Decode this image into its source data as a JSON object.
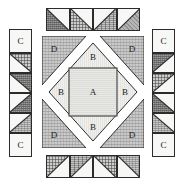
{
  "diagram": {
    "type": "quilt-block-layout",
    "labels": {
      "a": "A",
      "b": "B",
      "c": "C",
      "d": "D"
    },
    "colors": {
      "outline": "#2b2b2b",
      "background": "#ffffff",
      "light_fabric": "#ececec",
      "cream_fabric": "#e6e6e2",
      "medium_fabric": "#b5b5b5",
      "dark_fabric": "#9a9a9a",
      "grid_fabric": "#cdcdcd",
      "dot_fabric": "#c9c9c9"
    }
  },
  "center_block": {
    "name": "square-in-a-square center unit",
    "center_square": {
      "label": "A",
      "fabric": "cream"
    },
    "diamond_triangles": [
      {
        "label": "B",
        "position": "top",
        "fabric": "light"
      },
      {
        "label": "B",
        "position": "left",
        "fabric": "light"
      },
      {
        "label": "B",
        "position": "right",
        "fabric": "light"
      },
      {
        "label": "B",
        "position": "bottom",
        "fabric": "light"
      }
    ],
    "corner_triangles": [
      {
        "label": "D",
        "position": "top-left",
        "fabric": "dot"
      },
      {
        "label": "D",
        "position": "top-right",
        "fabric": "dot"
      },
      {
        "label": "D",
        "position": "bottom-left",
        "fabric": "dot"
      },
      {
        "label": "D",
        "position": "bottom-right",
        "fabric": "dot"
      }
    ]
  },
  "top_strip": {
    "name": "top half-square-triangle border",
    "unit_count": 4,
    "units": [
      {
        "index": 1,
        "dark_corner": "bottom-left",
        "fabric": "dark"
      },
      {
        "index": 2,
        "dark_corner": "bottom-left",
        "fabric": "grid"
      },
      {
        "index": 3,
        "dark_corner": "bottom-right",
        "fabric": "speck"
      },
      {
        "index": 4,
        "dark_corner": "bottom-right",
        "fabric": "med"
      }
    ]
  },
  "bottom_strip": {
    "name": "bottom half-square-triangle border",
    "unit_count": 4,
    "units": [
      {
        "index": 1,
        "dark_corner": "top-left",
        "fabric": "grid"
      },
      {
        "index": 2,
        "dark_corner": "top-left",
        "fabric": "speck"
      },
      {
        "index": 3,
        "dark_corner": "top-right",
        "fabric": "grid"
      },
      {
        "index": 4,
        "dark_corner": "top-right",
        "fabric": "dot"
      }
    ]
  },
  "left_column": {
    "name": "left side border column",
    "top_square": {
      "label": "C",
      "fabric": "light"
    },
    "bottom_square": {
      "label": "C",
      "fabric": "light"
    },
    "unit_count": 4,
    "units": [
      {
        "index": 1,
        "dark_corner": "top-right",
        "fabric": "grid"
      },
      {
        "index": 2,
        "dark_corner": "top-right",
        "fabric": "dark"
      },
      {
        "index": 3,
        "dark_corner": "bottom-right",
        "fabric": "dark"
      },
      {
        "index": 4,
        "dark_corner": "bottom-right",
        "fabric": "dot"
      }
    ]
  },
  "right_column": {
    "name": "right side border column",
    "top_square": {
      "label": "C",
      "fabric": "light"
    },
    "bottom_square": {
      "label": "C",
      "fabric": "light"
    },
    "unit_count": 4,
    "units": [
      {
        "index": 1,
        "dark_corner": "top-left",
        "fabric": "dark"
      },
      {
        "index": 2,
        "dark_corner": "top-left",
        "fabric": "grid"
      },
      {
        "index": 3,
        "dark_corner": "bottom-left",
        "fabric": "dark"
      },
      {
        "index": 4,
        "dark_corner": "bottom-left",
        "fabric": "dot"
      }
    ]
  }
}
